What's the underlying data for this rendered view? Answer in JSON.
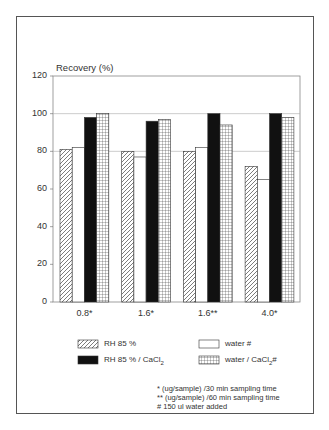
{
  "chart_data": {
    "type": "bar",
    "title": "",
    "ylabel": "Recovery (%)",
    "xlabel": "",
    "ylim": [
      0,
      120
    ],
    "yticks": [
      0,
      20,
      40,
      60,
      80,
      100,
      120
    ],
    "gridlines": [
      80,
      100
    ],
    "categories": [
      "0.8*",
      "1.6*",
      "1.6**",
      "4.0*"
    ],
    "series": [
      {
        "name": "RH 85 %",
        "pattern": "diagonal-hatch",
        "values": [
          81,
          80,
          80,
          72
        ]
      },
      {
        "name": "water #",
        "pattern": "empty",
        "values": [
          82,
          77,
          82,
          65
        ]
      },
      {
        "name": "RH 85 % / CaCl2",
        "pattern": "solid-black",
        "values": [
          98,
          96,
          100,
          100
        ]
      },
      {
        "name": "water / CaCl2 #",
        "pattern": "grid",
        "values": [
          100,
          97,
          94,
          98
        ]
      }
    ],
    "legend_position": "bottom",
    "footnotes": [
      "* (ug/sample) /30 min sampling time",
      "** (ug/sample) /60 min sampling time",
      "# 150 ul water added"
    ]
  },
  "labels": {
    "ylabel": "Recovery (%)",
    "yticks": [
      "0",
      "20",
      "40",
      "60",
      "80",
      "100",
      "120"
    ],
    "xticks": [
      "0.8*",
      "1.6*",
      "1.6**",
      "4.0*"
    ],
    "legend": [
      {
        "main": "RH 85 %",
        "sub": ""
      },
      {
        "main": "water #",
        "sub": ""
      },
      {
        "main": "RH 85 % / CaCl",
        "sub": "2"
      },
      {
        "main": "water / CaCl",
        "sub": "2",
        "suffix": "#"
      }
    ],
    "footnotes": [
      "* (ug/sample) /30 min sampling time",
      "** (ug/sample) /60 min sampling time",
      "# 150 ul water added"
    ]
  }
}
